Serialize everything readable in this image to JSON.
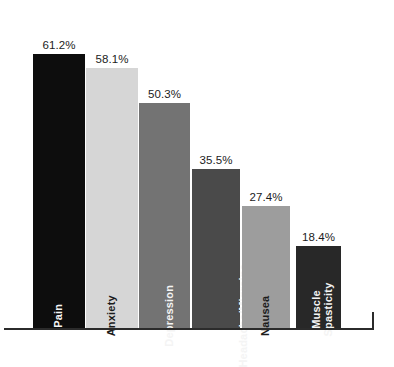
{
  "chart_data": {
    "type": "bar",
    "title": "",
    "subtitle": "",
    "xlabel": "",
    "ylabel": "",
    "ylim": [
      0,
      65
    ],
    "grid": false,
    "legend": "none",
    "orientation": "vertical",
    "value_label_format": "percent-one-decimal",
    "categories": [
      "Pain",
      "Anxiety",
      "Depression",
      "Headache/Migraine",
      "Nausea",
      "Muscle Spasticity"
    ],
    "values": [
      61.2,
      58.1,
      50.3,
      35.5,
      27.4,
      18.4
    ],
    "value_labels": [
      "61.2%",
      "58.1%",
      "50.3%",
      "35.5%",
      "27.4%",
      "18.4%"
    ],
    "bars": [
      {
        "category": "Pain",
        "label_lines": [
          "Pain"
        ],
        "value": 61.2,
        "value_label": "61.2%",
        "color": "#0d0d0d",
        "label_color": "light"
      },
      {
        "category": "Anxiety",
        "label_lines": [
          "Anxiety"
        ],
        "value": 58.1,
        "value_label": "58.1%",
        "color": "#d6d6d6",
        "label_color": "dark"
      },
      {
        "category": "Depression",
        "label_lines": [
          "Depression"
        ],
        "value": 50.3,
        "value_label": "50.3%",
        "color": "#737373",
        "label_color": "light"
      },
      {
        "category": "Headache/Migraine",
        "label_lines": [
          "Headache/Migraine"
        ],
        "value": 35.5,
        "value_label": "35.5%",
        "color": "#4a4a4a",
        "label_color": "light"
      },
      {
        "category": "Nausea",
        "label_lines": [
          "Nausea"
        ],
        "value": 27.4,
        "value_label": "27.4%",
        "color": "#9d9d9d",
        "label_color": "dark"
      },
      {
        "category": "Muscle Spasticity",
        "label_lines": [
          "Muscle",
          "Spasticity"
        ],
        "value": 18.4,
        "value_label": "18.4%",
        "color": "#282828",
        "label_color": "light"
      }
    ],
    "axis_color": "#2b2b2b"
  }
}
